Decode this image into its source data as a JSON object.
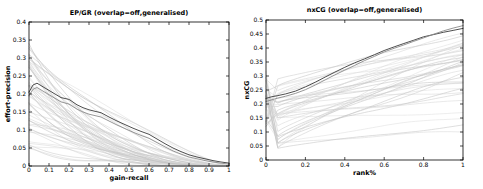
{
  "figure": {
    "background": "#ffffff",
    "axis_color": "#000000",
    "highlight_dark_color": "#3a3a3a",
    "highlight_mid_color": "#8a8a8a",
    "background_line_colors": [
      "#c6c6c6",
      "#d3d3d3",
      "#bcbcbc",
      "#dadada"
    ]
  },
  "chart_data": [
    {
      "type": "line",
      "title": "EP/GR (overlap=off,generalised)",
      "xlabel": "gain-recall",
      "ylabel": "effort-precision",
      "xlim": [
        0,
        1
      ],
      "ylim": [
        0,
        0.4
      ],
      "xtick_labels": [
        "0",
        "0.1",
        "0.2",
        "0.3",
        "0.4",
        "0.5",
        "0.6",
        "0.7",
        "0.8",
        "0.9",
        "1"
      ],
      "ytick_labels": [
        "0",
        "0.05",
        "0.1",
        "0.15",
        "0.2",
        "0.25",
        "0.3",
        "0.35",
        "0.4"
      ],
      "grid": false,
      "legend": "none",
      "highlight_series": [
        {
          "name": "top-run-dark",
          "points": [
            [
              0,
              0.205
            ],
            [
              0.02,
              0.225
            ],
            [
              0.04,
              0.23
            ],
            [
              0.07,
              0.22
            ],
            [
              0.1,
              0.21
            ],
            [
              0.13,
              0.2
            ],
            [
              0.16,
              0.19
            ],
            [
              0.2,
              0.185
            ],
            [
              0.24,
              0.17
            ],
            [
              0.27,
              0.162
            ],
            [
              0.3,
              0.156
            ],
            [
              0.33,
              0.152
            ],
            [
              0.36,
              0.148
            ],
            [
              0.4,
              0.136
            ],
            [
              0.44,
              0.125
            ],
            [
              0.48,
              0.115
            ],
            [
              0.52,
              0.105
            ],
            [
              0.56,
              0.096
            ],
            [
              0.6,
              0.088
            ],
            [
              0.64,
              0.075
            ],
            [
              0.68,
              0.062
            ],
            [
              0.72,
              0.05
            ],
            [
              0.76,
              0.04
            ],
            [
              0.8,
              0.031
            ],
            [
              0.84,
              0.025
            ],
            [
              0.88,
              0.02
            ],
            [
              0.92,
              0.015
            ],
            [
              0.96,
              0.011
            ],
            [
              1,
              0.008
            ]
          ]
        },
        {
          "name": "top-run-mid",
          "points": [
            [
              0,
              0.195
            ],
            [
              0.02,
              0.213
            ],
            [
              0.04,
              0.218
            ],
            [
              0.07,
              0.208
            ],
            [
              0.1,
              0.198
            ],
            [
              0.13,
              0.188
            ],
            [
              0.16,
              0.178
            ],
            [
              0.2,
              0.172
            ],
            [
              0.24,
              0.158
            ],
            [
              0.27,
              0.15
            ],
            [
              0.3,
              0.144
            ],
            [
              0.33,
              0.14
            ],
            [
              0.36,
              0.136
            ],
            [
              0.4,
              0.125
            ],
            [
              0.44,
              0.114
            ],
            [
              0.48,
              0.104
            ],
            [
              0.52,
              0.094
            ],
            [
              0.56,
              0.085
            ],
            [
              0.6,
              0.077
            ],
            [
              0.64,
              0.065
            ],
            [
              0.68,
              0.053
            ],
            [
              0.72,
              0.042
            ],
            [
              0.76,
              0.033
            ],
            [
              0.8,
              0.025
            ],
            [
              0.84,
              0.02
            ],
            [
              0.88,
              0.015
            ],
            [
              0.92,
              0.011
            ],
            [
              0.96,
              0.008
            ],
            [
              1,
              0.005
            ]
          ]
        }
      ],
      "background_series": {
        "shape": "decay",
        "count": 55,
        "seed": 7,
        "start_range": [
          0.03,
          0.34
        ],
        "end_range": [
          0,
          0.01
        ]
      }
    },
    {
      "type": "line",
      "title": "nxCG (overlap=off,generalised)",
      "xlabel": "rank%",
      "ylabel": "nxCG",
      "xlim": [
        0,
        1
      ],
      "ylim": [
        0,
        0.5
      ],
      "xtick_labels": [
        "0",
        "0.2",
        "0.4",
        "0.6",
        "0.8",
        "1"
      ],
      "ytick_labels": [
        "0",
        "0.05",
        "0.1",
        "0.15",
        "0.2",
        "0.25",
        "0.3",
        "0.35",
        "0.4",
        "0.45",
        "0.5"
      ],
      "grid": false,
      "legend": "none",
      "highlight_series": [
        {
          "name": "top-run-dark",
          "points": [
            [
              0,
              0.22
            ],
            [
              0.03,
              0.226
            ],
            [
              0.06,
              0.23
            ],
            [
              0.1,
              0.236
            ],
            [
              0.15,
              0.246
            ],
            [
              0.2,
              0.261
            ],
            [
              0.25,
              0.278
            ],
            [
              0.3,
              0.296
            ],
            [
              0.35,
              0.314
            ],
            [
              0.4,
              0.331
            ],
            [
              0.45,
              0.347
            ],
            [
              0.5,
              0.361
            ],
            [
              0.55,
              0.376
            ],
            [
              0.6,
              0.391
            ],
            [
              0.65,
              0.404
            ],
            [
              0.7,
              0.416
            ],
            [
              0.75,
              0.428
            ],
            [
              0.8,
              0.44
            ],
            [
              0.85,
              0.448
            ],
            [
              0.9,
              0.456
            ],
            [
              0.95,
              0.463
            ],
            [
              1,
              0.47
            ]
          ]
        },
        {
          "name": "top-run-mid",
          "points": [
            [
              0,
              0.209
            ],
            [
              0.03,
              0.215
            ],
            [
              0.06,
              0.221
            ],
            [
              0.1,
              0.228
            ],
            [
              0.15,
              0.238
            ],
            [
              0.2,
              0.251
            ],
            [
              0.25,
              0.268
            ],
            [
              0.3,
              0.286
            ],
            [
              0.35,
              0.304
            ],
            [
              0.4,
              0.321
            ],
            [
              0.45,
              0.338
            ],
            [
              0.5,
              0.355
            ],
            [
              0.55,
              0.37
            ],
            [
              0.6,
              0.386
            ],
            [
              0.65,
              0.399
            ],
            [
              0.7,
              0.411
            ],
            [
              0.75,
              0.424
            ],
            [
              0.8,
              0.436
            ],
            [
              0.85,
              0.449
            ],
            [
              0.9,
              0.461
            ],
            [
              0.95,
              0.471
            ],
            [
              1,
              0.48
            ]
          ]
        }
      ],
      "background_series": {
        "shape": "rise",
        "count": 38,
        "seed": 11,
        "start_range": [
          0.12,
          0.32
        ],
        "base_range": [
          0.04,
          0.29
        ],
        "end_max": 0.455
      }
    }
  ]
}
